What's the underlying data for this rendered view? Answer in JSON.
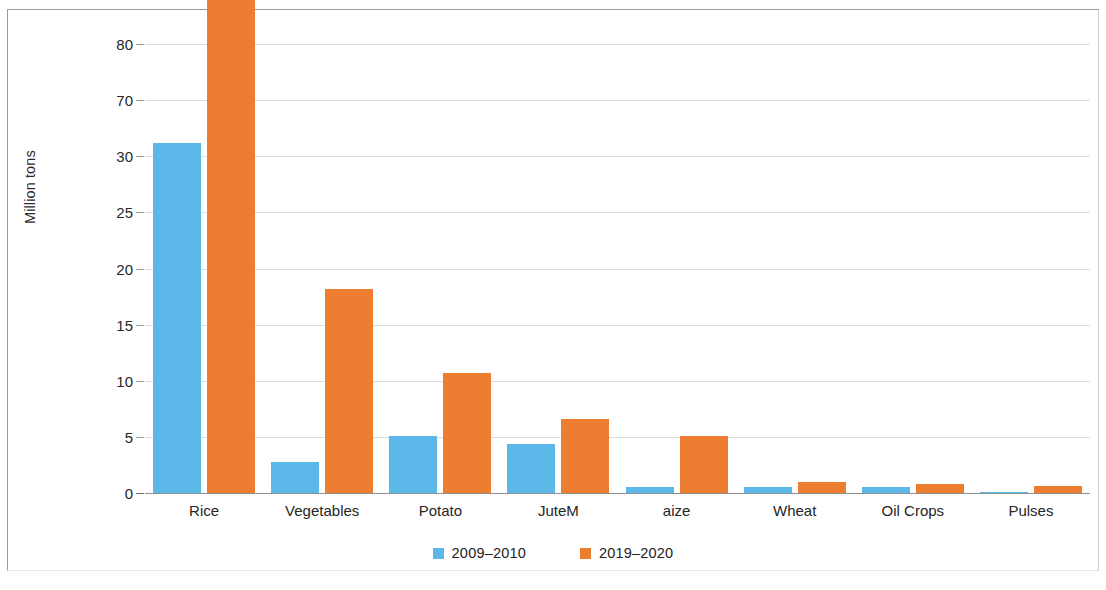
{
  "chart_data": {
    "type": "bar",
    "title": "",
    "xlabel": "",
    "ylabel": "Million tons",
    "grid": true,
    "legend_position": "bottom",
    "categories": [
      "Rice",
      "Vegetables",
      "Potato",
      "JuteM",
      "aize",
      "Wheat",
      "Oil Crops",
      "Pulses"
    ],
    "y_tick_labels": [
      "80",
      "70",
      "30",
      "25",
      "20",
      "15",
      "10",
      "5",
      "0"
    ],
    "y_axis_note": "irregular tick sequence as printed: 80, 70, 30, 25, 20, 15, 10, 5, 0",
    "series": [
      {
        "name": "2009–2010",
        "color": "#5bb8e8",
        "values": [
          31.2,
          2.8,
          5.1,
          4.4,
          0.5,
          0.55,
          0.5,
          0.05
        ]
      },
      {
        "name": "2019–2020",
        "color": "#ed7d31",
        "values": [
          77.0,
          18.2,
          10.7,
          6.6,
          5.1,
          0.95,
          0.8,
          0.65
        ]
      }
    ]
  },
  "legend": {
    "items": [
      {
        "label": "2009–2010",
        "swatch": "blue-square-swatch"
      },
      {
        "label": "2019–2020",
        "swatch": "orange-square-swatch"
      }
    ]
  },
  "colors": {
    "series_2009_2010": "#5bb8e8",
    "series_2019_2020": "#ed7d31",
    "gridline": "#dcdcdc",
    "axis": "#8f8f8f",
    "text": "#262626",
    "background": "#ffffff"
  }
}
